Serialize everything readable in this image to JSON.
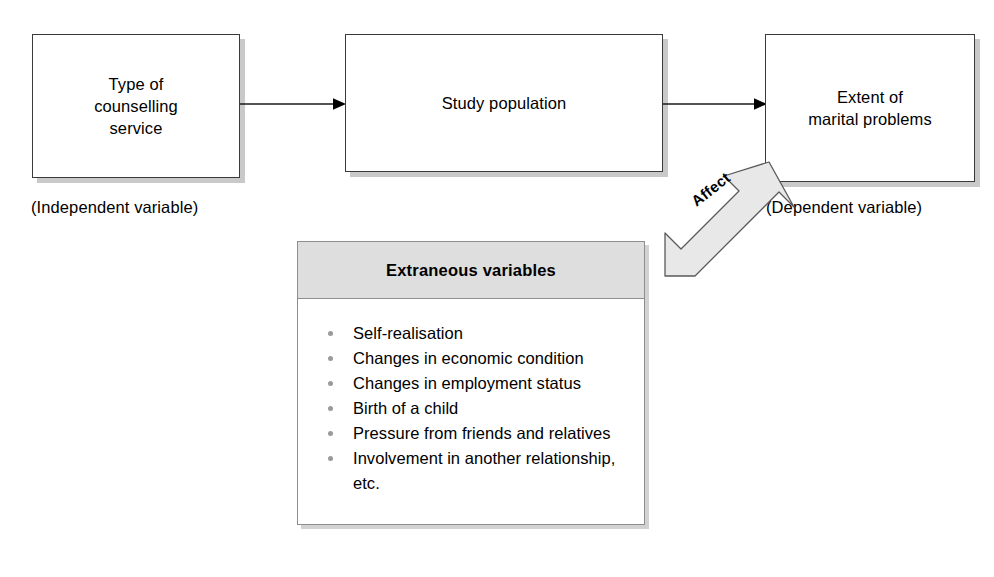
{
  "diagram": {
    "nodes": [
      {
        "id": "independent",
        "label": "Type of\ncounselling\nservice",
        "caption": "(Independent variable)"
      },
      {
        "id": "population",
        "label": "Study population",
        "caption": ""
      },
      {
        "id": "dependent",
        "label": "Extent of\nmarital problems",
        "caption": "(Dependent variable)"
      }
    ],
    "connectors": [
      {
        "id": "arrow-independent-to-population",
        "icon": "arrow-right-icon"
      },
      {
        "id": "arrow-population-to-dependent",
        "icon": "arrow-right-icon"
      }
    ],
    "affect_arrow": {
      "label": "Affect",
      "icon": "block-arrow-up-right-icon",
      "fill": "#e8e8e8",
      "stroke": "#5a5a5a"
    },
    "extraneous": {
      "title": "Extraneous variables",
      "header_fill": "#dedede",
      "items": [
        "Self-realisation",
        "Changes in economic condition",
        "Changes in employment status",
        "Birth of a child",
        "Pressure from friends and relatives",
        "Involvement in another relationship,"
      ],
      "trailing_text": "etc."
    },
    "colors": {
      "box_border": "#3a3a3a",
      "box_shadow": "#c9c9c9",
      "panel_border": "#8e8e8e",
      "bullet": "#9a9a9a",
      "line": "#1a1a1a",
      "background": "#ffffff"
    }
  }
}
